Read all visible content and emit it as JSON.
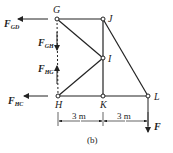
{
  "figure": {
    "caption": "(b)",
    "nodes": [
      {
        "id": "G",
        "label": "G",
        "x": 57,
        "y": 19
      },
      {
        "id": "J",
        "label": "J",
        "x": 103,
        "y": 19
      },
      {
        "id": "I",
        "label": "I",
        "x": 103,
        "y": 58
      },
      {
        "id": "H",
        "label": "H",
        "x": 58,
        "y": 96
      },
      {
        "id": "K",
        "label": "K",
        "x": 103,
        "y": 96
      },
      {
        "id": "L",
        "label": "L",
        "x": 148,
        "y": 96
      }
    ],
    "members": [
      [
        "G",
        "J"
      ],
      [
        "G",
        "I"
      ],
      [
        "H",
        "I"
      ],
      [
        "J",
        "I"
      ],
      [
        "I",
        "K"
      ],
      [
        "J",
        "L"
      ],
      [
        "H",
        "K"
      ],
      [
        "K",
        "L"
      ]
    ],
    "forces": {
      "f_gd": {
        "main": "F",
        "sub": "GD"
      },
      "f_gh": {
        "main": "F",
        "sub": "GH"
      },
      "f_hg": {
        "main": "F",
        "sub": "HG"
      },
      "f_hc": {
        "main": "F",
        "sub": "HC"
      },
      "f_load": {
        "main": "F"
      }
    },
    "dimensions": {
      "left": "3 m",
      "right": "3 m"
    }
  }
}
